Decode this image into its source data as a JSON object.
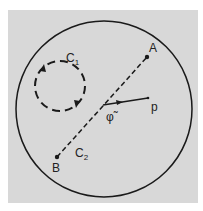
{
  "diagram": {
    "background_color": "#d8d8d8",
    "stroke_color": "#1a1a1a",
    "outer_circle": {
      "cx": 104,
      "cy": 109,
      "r": 88
    },
    "loop_C1": {
      "label": "C",
      "subscript": "1",
      "cx": 60,
      "cy": 86,
      "r": 25,
      "style": "dashed"
    },
    "path_C2": {
      "label": "C",
      "subscript": "2",
      "from": "B",
      "to": "A",
      "style": "dashed"
    },
    "points": [
      {
        "name": "A",
        "x": 147,
        "y": 57
      },
      {
        "name": "B",
        "x": 57,
        "y": 157
      }
    ],
    "vector": {
      "label": "p",
      "from_x": 103,
      "from_y": 105,
      "to_x": 148,
      "to_y": 98
    },
    "angle_label": "φ̃"
  }
}
